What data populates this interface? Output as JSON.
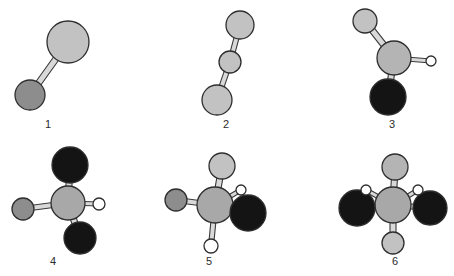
{
  "figure": {
    "background_color": "#ffffff",
    "width": 454,
    "height": 276,
    "bond_style": "outlined-cylinder",
    "bond_outline_color": "#3a3a3a",
    "bond_fill_color": "#d9d9d9"
  },
  "palette": {
    "light_gray_atom": "#c2c2c2",
    "medium_gray_atom": "#8d8d8d",
    "center_gray_atom": "#a8a8a8",
    "black_atom": "#141414",
    "white_atom": "#ffffff",
    "outline": "#2e2e2e",
    "label_color": "#2b2b2b"
  },
  "labels": [
    {
      "text": "1",
      "x": 48,
      "y": 124
    },
    {
      "text": "2",
      "x": 226,
      "y": 124
    },
    {
      "text": "3",
      "x": 392,
      "y": 124
    },
    {
      "text": "4",
      "x": 53,
      "y": 261
    },
    {
      "text": "5",
      "x": 209,
      "y": 261
    },
    {
      "text": "6",
      "x": 395,
      "y": 261
    }
  ],
  "structures": [
    {
      "id": "structure-1",
      "label": "1",
      "atoms": [
        {
          "name": "atom-large-light",
          "x": 68,
          "y": 42,
          "r": 21,
          "fill": "#c2c2c2"
        },
        {
          "name": "atom-small-medium",
          "x": 30,
          "y": 95,
          "r": 15,
          "fill": "#8d8d8d"
        }
      ],
      "bonds": [
        {
          "name": "bond-1",
          "x1": 68,
          "y1": 42,
          "x2": 30,
          "y2": 95,
          "w": 6
        }
      ]
    },
    {
      "id": "structure-2",
      "label": "2",
      "atoms": [
        {
          "name": "atom-top-light",
          "x": 240,
          "y": 25,
          "r": 14,
          "fill": "#c2c2c2"
        },
        {
          "name": "atom-middle-light",
          "x": 230,
          "y": 62,
          "r": 11,
          "fill": "#c2c2c2"
        },
        {
          "name": "atom-bottom-light",
          "x": 217,
          "y": 100,
          "r": 15,
          "fill": "#c2c2c2"
        }
      ],
      "bonds": [
        {
          "name": "bond-1",
          "x1": 240,
          "y1": 25,
          "x2": 230,
          "y2": 62,
          "w": 5
        },
        {
          "name": "bond-2",
          "x1": 230,
          "y1": 62,
          "x2": 217,
          "y2": 100,
          "w": 5
        }
      ]
    },
    {
      "id": "structure-3",
      "label": "3",
      "atoms": [
        {
          "name": "atom-upper-left-light",
          "x": 365,
          "y": 21,
          "r": 12,
          "fill": "#c2c2c2"
        },
        {
          "name": "atom-center-light",
          "x": 394,
          "y": 58,
          "r": 17,
          "fill": "#b4b4b4"
        },
        {
          "name": "atom-right-white",
          "x": 431,
          "y": 61,
          "r": 5,
          "fill": "#ffffff"
        },
        {
          "name": "atom-bottom-black",
          "x": 388,
          "y": 97,
          "r": 18,
          "fill": "#141414"
        }
      ],
      "bonds": [
        {
          "name": "bond-1",
          "x1": 394,
          "y1": 58,
          "x2": 365,
          "y2": 21,
          "w": 6
        },
        {
          "name": "bond-2",
          "x1": 394,
          "y1": 58,
          "x2": 431,
          "y2": 61,
          "w": 4
        },
        {
          "name": "bond-3",
          "x1": 394,
          "y1": 58,
          "x2": 388,
          "y2": 97,
          "w": 6
        }
      ]
    },
    {
      "id": "structure-4",
      "label": "4",
      "atoms": [
        {
          "name": "atom-top-black",
          "x": 70,
          "y": 165,
          "r": 18,
          "fill": "#141414"
        },
        {
          "name": "atom-center-gray",
          "x": 68,
          "y": 203,
          "r": 17,
          "fill": "#a8a8a8"
        },
        {
          "name": "atom-left-medium",
          "x": 23,
          "y": 209,
          "r": 11,
          "fill": "#8d8d8d"
        },
        {
          "name": "atom-right-white",
          "x": 99,
          "y": 204,
          "r": 6,
          "fill": "#ffffff"
        },
        {
          "name": "atom-bottom-black",
          "x": 80,
          "y": 238,
          "r": 16,
          "fill": "#141414"
        }
      ],
      "bonds": [
        {
          "name": "bond-1",
          "x1": 68,
          "y1": 203,
          "x2": 70,
          "y2": 165,
          "w": 6
        },
        {
          "name": "bond-2",
          "x1": 68,
          "y1": 203,
          "x2": 23,
          "y2": 209,
          "w": 5
        },
        {
          "name": "bond-3",
          "x1": 68,
          "y1": 203,
          "x2": 99,
          "y2": 204,
          "w": 4
        },
        {
          "name": "bond-4",
          "x1": 68,
          "y1": 203,
          "x2": 80,
          "y2": 238,
          "w": 6
        }
      ]
    },
    {
      "id": "structure-5",
      "label": "5",
      "atoms": [
        {
          "name": "atom-top-light",
          "x": 222,
          "y": 166,
          "r": 13,
          "fill": "#c2c2c2"
        },
        {
          "name": "atom-center-gray",
          "x": 215,
          "y": 205,
          "r": 18,
          "fill": "#a8a8a8"
        },
        {
          "name": "atom-left-medium",
          "x": 176,
          "y": 200,
          "r": 11,
          "fill": "#8d8d8d"
        },
        {
          "name": "atom-upper-right-white",
          "x": 241,
          "y": 190,
          "r": 5,
          "fill": "#ffffff"
        },
        {
          "name": "atom-lower-right-black",
          "x": 248,
          "y": 213,
          "r": 18,
          "fill": "#141414"
        },
        {
          "name": "atom-bottom-white",
          "x": 211,
          "y": 246,
          "r": 7,
          "fill": "#ffffff"
        }
      ],
      "bonds": [
        {
          "name": "bond-1",
          "x1": 215,
          "y1": 205,
          "x2": 222,
          "y2": 166,
          "w": 6
        },
        {
          "name": "bond-2",
          "x1": 215,
          "y1": 205,
          "x2": 176,
          "y2": 200,
          "w": 5
        },
        {
          "name": "bond-3",
          "x1": 215,
          "y1": 205,
          "x2": 241,
          "y2": 190,
          "w": 4
        },
        {
          "name": "bond-4",
          "x1": 215,
          "y1": 205,
          "x2": 248,
          "y2": 213,
          "w": 5
        },
        {
          "name": "bond-5",
          "x1": 215,
          "y1": 205,
          "x2": 211,
          "y2": 246,
          "w": 5
        }
      ]
    },
    {
      "id": "structure-6",
      "label": "6",
      "atoms": [
        {
          "name": "atom-top-light",
          "x": 395,
          "y": 167,
          "r": 13,
          "fill": "#b4b4b4"
        },
        {
          "name": "atom-center-gray",
          "x": 393,
          "y": 205,
          "r": 18,
          "fill": "#a8a8a8"
        },
        {
          "name": "atom-left-black",
          "x": 357,
          "y": 208,
          "r": 18,
          "fill": "#141414"
        },
        {
          "name": "atom-right-black",
          "x": 430,
          "y": 208,
          "r": 17,
          "fill": "#141414"
        },
        {
          "name": "atom-bottom-light",
          "x": 393,
          "y": 243,
          "r": 11,
          "fill": "#c2c2c2"
        },
        {
          "name": "atom-left-white",
          "x": 366,
          "y": 190,
          "r": 5,
          "fill": "#ffffff"
        },
        {
          "name": "atom-right-white",
          "x": 418,
          "y": 190,
          "r": 5,
          "fill": "#ffffff"
        }
      ],
      "bonds": [
        {
          "name": "bond-1",
          "x1": 393,
          "y1": 205,
          "x2": 395,
          "y2": 167,
          "w": 6
        },
        {
          "name": "bond-2",
          "x1": 393,
          "y1": 205,
          "x2": 357,
          "y2": 208,
          "w": 5
        },
        {
          "name": "bond-3",
          "x1": 393,
          "y1": 205,
          "x2": 430,
          "y2": 208,
          "w": 5
        },
        {
          "name": "bond-4",
          "x1": 393,
          "y1": 205,
          "x2": 393,
          "y2": 243,
          "w": 6
        },
        {
          "name": "bond-5",
          "x1": 393,
          "y1": 205,
          "x2": 366,
          "y2": 190,
          "w": 4
        },
        {
          "name": "bond-6",
          "x1": 393,
          "y1": 205,
          "x2": 418,
          "y2": 190,
          "w": 4
        }
      ]
    }
  ]
}
